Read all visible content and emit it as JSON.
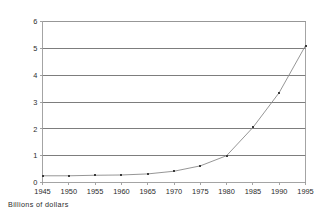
{
  "caption": "Billions of dollars",
  "chart_data": {
    "type": "line",
    "title": "",
    "subtitle": "",
    "xlabel": "",
    "ylabel": "",
    "axis_note": "Billions of dollars",
    "x": [
      1945,
      1950,
      1955,
      1960,
      1965,
      1970,
      1975,
      1980,
      1985,
      1990,
      1995
    ],
    "xtick_labels": [
      "1945",
      "1950",
      "1955",
      "1960",
      "1965",
      "1970",
      "1975",
      "1980",
      "1985",
      "1990",
      "1995"
    ],
    "values": [
      0.25,
      0.25,
      0.27,
      0.28,
      0.32,
      0.42,
      0.62,
      1.0,
      2.05,
      3.35,
      5.1
    ],
    "ytick_labels": [
      "0",
      "1",
      "2",
      "3",
      "4",
      "5",
      "6"
    ],
    "yticks": [
      0,
      1,
      2,
      3,
      4,
      5,
      6
    ],
    "xlim": [
      1945,
      1995
    ],
    "ylim": [
      0,
      6
    ],
    "grid": "horizontal",
    "legend": "none",
    "legend_position": "none",
    "marker": "square",
    "series": [
      {
        "name": "Billions of dollars",
        "values": [
          0.25,
          0.25,
          0.27,
          0.28,
          0.32,
          0.42,
          0.62,
          1.0,
          2.05,
          3.35,
          5.1
        ]
      }
    ],
    "colors": {
      "line": "#8a8a8a",
      "marker": "#3a3a3a",
      "grid": "#6f6f6f",
      "axis": "#9a9a9a",
      "text": "#2b2b2b",
      "background": "#ffffff"
    }
  }
}
